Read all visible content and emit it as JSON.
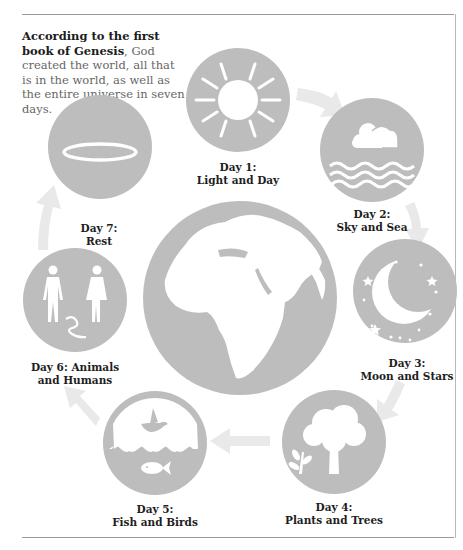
{
  "intro": {
    "bold": "According to the first book of Genesis",
    "rest": ", God created the world, all that is in the world, as well as the entire universe in seven days."
  },
  "colors": {
    "circle_fill": "#bdbdbd",
    "arrow_fill": "#e9e9e9",
    "icon_fill": "#ffffff",
    "rule": "#9a9a9a"
  },
  "center": {
    "icon": "globe-icon"
  },
  "days": [
    {
      "number": "Day 1:",
      "title": "Light and Day",
      "icon": "sun-icon"
    },
    {
      "number": "Day 2:",
      "title": "Sky and Sea",
      "icon": "clouds-waves-icon"
    },
    {
      "number": "Day 3:",
      "title": "Moon and Stars",
      "icon": "moon-stars-icon"
    },
    {
      "number": "Day 4:",
      "title": "Plants and Trees",
      "icon": "tree-icon"
    },
    {
      "number": "Day 5:",
      "title": "Fish and Birds",
      "icon": "fish-bird-icon"
    },
    {
      "number": "Day 6: Animals",
      "title": "and Humans",
      "icon": "humans-snake-icon"
    },
    {
      "number": "Day 7:",
      "title": "Rest",
      "icon": "halo-icon"
    }
  ]
}
